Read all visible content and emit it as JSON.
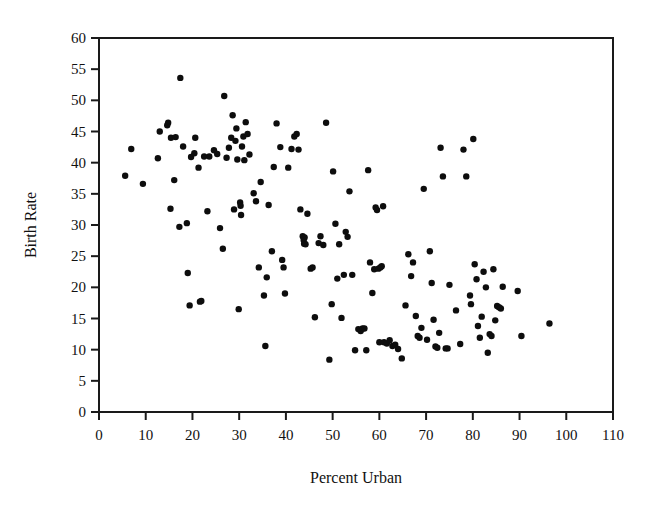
{
  "chart_data": {
    "type": "scatter",
    "title": "",
    "xlabel": "Percent Urban",
    "ylabel": "Birth Rate",
    "xlim": [
      0,
      110
    ],
    "ylim": [
      0,
      60
    ],
    "xticks": [
      0,
      10,
      20,
      30,
      40,
      50,
      60,
      70,
      80,
      90,
      100,
      110
    ],
    "yticks": [
      0,
      5,
      10,
      15,
      20,
      25,
      30,
      35,
      40,
      45,
      50,
      55,
      60
    ],
    "xtick_labels": [
      "0",
      "10",
      "20",
      "30",
      "40",
      "50",
      "60",
      "70",
      "80",
      "90",
      "100",
      "110"
    ],
    "ytick_labels": [
      "0",
      "5",
      "10",
      "15",
      "20",
      "25",
      "30",
      "35",
      "40",
      "45",
      "50",
      "55",
      "60"
    ],
    "grid": false,
    "legend": null,
    "marker": {
      "shape": "circle",
      "color": "#0d0d0d",
      "size_px": 6.4
    },
    "n_points": 162,
    "points": [
      [
        5.6,
        37.9
      ],
      [
        9.4,
        36.6
      ],
      [
        6.9,
        42.2
      ],
      [
        12.6,
        40.7
      ],
      [
        13.0,
        45.0
      ],
      [
        14.6,
        46.0
      ],
      [
        14.8,
        46.4
      ],
      [
        15.4,
        44.0
      ],
      [
        15.3,
        32.6
      ],
      [
        16.1,
        37.2
      ],
      [
        16.4,
        44.1
      ],
      [
        17.4,
        53.6
      ],
      [
        18.0,
        42.6
      ],
      [
        17.2,
        29.7
      ],
      [
        18.8,
        30.3
      ],
      [
        19.0,
        22.3
      ],
      [
        19.4,
        17.1
      ],
      [
        19.7,
        40.9
      ],
      [
        20.4,
        41.5
      ],
      [
        20.6,
        44.0
      ],
      [
        21.3,
        39.2
      ],
      [
        21.6,
        17.7
      ],
      [
        21.9,
        17.8
      ],
      [
        22.5,
        41.0
      ],
      [
        23.2,
        32.2
      ],
      [
        23.6,
        41.0
      ],
      [
        24.6,
        42.0
      ],
      [
        25.3,
        41.4
      ],
      [
        25.9,
        29.5
      ],
      [
        26.5,
        26.2
      ],
      [
        26.8,
        50.7
      ],
      [
        27.3,
        40.8
      ],
      [
        27.8,
        42.4
      ],
      [
        28.3,
        44.0
      ],
      [
        28.6,
        47.6
      ],
      [
        28.9,
        32.5
      ],
      [
        29.2,
        43.5
      ],
      [
        29.4,
        45.5
      ],
      [
        29.6,
        40.5
      ],
      [
        29.9,
        16.5
      ],
      [
        30.2,
        33.6
      ],
      [
        30.3,
        33.1
      ],
      [
        30.4,
        31.6
      ],
      [
        30.6,
        42.6
      ],
      [
        30.9,
        44.2
      ],
      [
        31.1,
        40.4
      ],
      [
        31.4,
        46.5
      ],
      [
        31.8,
        44.6
      ],
      [
        32.2,
        41.3
      ],
      [
        33.1,
        35.1
      ],
      [
        33.6,
        33.8
      ],
      [
        34.2,
        23.2
      ],
      [
        34.6,
        36.9
      ],
      [
        35.3,
        18.7
      ],
      [
        35.6,
        10.6
      ],
      [
        35.9,
        21.6
      ],
      [
        36.3,
        33.2
      ],
      [
        37.0,
        25.8
      ],
      [
        37.4,
        39.3
      ],
      [
        38.0,
        46.3
      ],
      [
        38.8,
        42.5
      ],
      [
        39.2,
        24.4
      ],
      [
        39.5,
        23.2
      ],
      [
        39.8,
        19.0
      ],
      [
        40.5,
        39.2
      ],
      [
        41.2,
        42.2
      ],
      [
        41.8,
        44.2
      ],
      [
        42.3,
        44.6
      ],
      [
        42.7,
        42.1
      ],
      [
        43.1,
        32.5
      ],
      [
        43.6,
        28.2
      ],
      [
        43.8,
        27.6
      ],
      [
        43.9,
        27.0
      ],
      [
        44.2,
        26.9
      ],
      [
        44.6,
        31.8
      ],
      [
        45.3,
        23.0
      ],
      [
        45.7,
        23.2
      ],
      [
        46.2,
        15.2
      ],
      [
        47.0,
        27.1
      ],
      [
        47.4,
        28.2
      ],
      [
        48.0,
        26.8
      ],
      [
        48.6,
        46.4
      ],
      [
        49.3,
        8.4
      ],
      [
        49.8,
        17.3
      ],
      [
        50.1,
        38.6
      ],
      [
        50.6,
        30.2
      ],
      [
        51.0,
        21.4
      ],
      [
        51.4,
        26.9
      ],
      [
        51.9,
        15.1
      ],
      [
        52.4,
        22.0
      ],
      [
        52.8,
        28.9
      ],
      [
        53.2,
        28.1
      ],
      [
        53.6,
        35.4
      ],
      [
        54.2,
        22.0
      ],
      [
        54.8,
        9.9
      ],
      [
        55.5,
        13.3
      ],
      [
        56.0,
        13.0
      ],
      [
        56.4,
        13.4
      ],
      [
        56.8,
        13.4
      ],
      [
        57.2,
        9.9
      ],
      [
        57.6,
        38.8
      ],
      [
        58.0,
        24.0
      ],
      [
        58.5,
        19.1
      ],
      [
        58.9,
        22.9
      ],
      [
        59.2,
        32.8
      ],
      [
        59.5,
        32.4
      ],
      [
        59.8,
        23.0
      ],
      [
        60.2,
        23.2
      ],
      [
        60.5,
        23.4
      ],
      [
        60.8,
        33.0
      ],
      [
        60.0,
        11.2
      ],
      [
        61.0,
        11.2
      ],
      [
        61.6,
        11.0
      ],
      [
        62.2,
        11.5
      ],
      [
        62.8,
        10.6
      ],
      [
        63.4,
        10.8
      ],
      [
        64.0,
        10.1
      ],
      [
        64.8,
        8.6
      ],
      [
        65.6,
        17.1
      ],
      [
        66.2,
        25.3
      ],
      [
        66.8,
        21.8
      ],
      [
        67.2,
        24.0
      ],
      [
        67.8,
        15.4
      ],
      [
        68.2,
        12.2
      ],
      [
        68.6,
        11.9
      ],
      [
        69.0,
        13.5
      ],
      [
        69.5,
        35.8
      ],
      [
        70.2,
        11.6
      ],
      [
        70.8,
        25.8
      ],
      [
        71.2,
        20.7
      ],
      [
        71.6,
        14.8
      ],
      [
        72.0,
        10.5
      ],
      [
        72.4,
        10.3
      ],
      [
        72.8,
        12.7
      ],
      [
        73.1,
        42.4
      ],
      [
        73.6,
        37.8
      ],
      [
        74.2,
        10.2
      ],
      [
        74.6,
        10.2
      ],
      [
        75.0,
        20.4
      ],
      [
        76.4,
        16.3
      ],
      [
        77.3,
        10.9
      ],
      [
        78.0,
        42.1
      ],
      [
        78.6,
        37.8
      ],
      [
        79.4,
        18.7
      ],
      [
        79.6,
        17.3
      ],
      [
        80.1,
        43.8
      ],
      [
        80.4,
        23.7
      ],
      [
        80.8,
        21.3
      ],
      [
        81.1,
        13.8
      ],
      [
        81.5,
        11.9
      ],
      [
        81.9,
        15.3
      ],
      [
        82.3,
        22.5
      ],
      [
        82.8,
        20.0
      ],
      [
        83.2,
        9.5
      ],
      [
        83.6,
        12.5
      ],
      [
        84.0,
        12.2
      ],
      [
        84.4,
        22.9
      ],
      [
        84.8,
        14.7
      ],
      [
        85.2,
        17.0
      ],
      [
        85.6,
        16.8
      ],
      [
        86.0,
        16.6
      ],
      [
        86.4,
        20.1
      ],
      [
        89.6,
        19.4
      ],
      [
        90.4,
        12.2
      ],
      [
        96.4,
        14.2
      ],
      [
        44.0,
        28.0
      ]
    ]
  },
  "axes": {
    "y_axis_title": "Birth Rate",
    "x_axis_title": "Percent Urban"
  },
  "colors": {
    "marker": "#0d0d0d",
    "axis": "#1a1a1a",
    "background": "#ffffff",
    "text": "#111111"
  }
}
